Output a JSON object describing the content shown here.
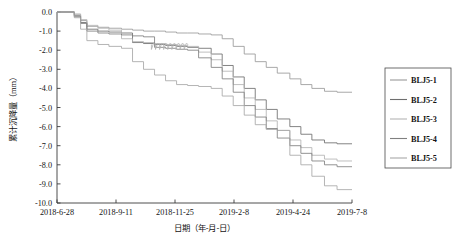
{
  "chart_data": {
    "type": "line",
    "title": "",
    "xlabel": "日期（年-月-日）",
    "ylabel": "累计沉降量（mm）",
    "x_tick_labels": [
      "2018-6-28",
      "2018-9-11",
      "2018-11-25",
      "2019-2-8",
      "2019-4-24",
      "2019-7-8"
    ],
    "y_tick_labels": [
      "0.0",
      "-1.0",
      "-2.0",
      "-3.0",
      "-4.0",
      "-5.0",
      "-6.0",
      "-7.0",
      "-8.0",
      "-9.0",
      "-10.0"
    ],
    "ylim": [
      -10.0,
      0.0
    ],
    "xlim": [
      0,
      375
    ],
    "grid": false,
    "legend_position": "right-outside",
    "x_tick_days": [
      0,
      75,
      150,
      225,
      300,
      375
    ],
    "series": [
      {
        "name": "BLJ5-1",
        "color": "#9a9a9a",
        "x": [
          0,
          14,
          22,
          30,
          38,
          52,
          66,
          82,
          96,
          110,
          124,
          138,
          152,
          166,
          180,
          196,
          210,
          224,
          238,
          252,
          266,
          280,
          296,
          310,
          324,
          340,
          356,
          375
        ],
        "y": [
          0.0,
          0.0,
          -0.15,
          -0.45,
          -0.75,
          -0.8,
          -0.85,
          -0.9,
          -0.95,
          -1.0,
          -1.0,
          -1.05,
          -1.1,
          -1.1,
          -1.15,
          -1.2,
          -1.4,
          -1.8,
          -2.2,
          -2.6,
          -2.9,
          -3.2,
          -3.5,
          -3.8,
          -4.0,
          -4.15,
          -4.2,
          -4.2
        ]
      },
      {
        "name": "BLJ5-2",
        "color": "#6e6e6e",
        "x": [
          0,
          14,
          22,
          30,
          38,
          52,
          66,
          82,
          96,
          110,
          124,
          138,
          152,
          166,
          180,
          196,
          210,
          224,
          238,
          252,
          266,
          280,
          296,
          310,
          324,
          340,
          356,
          375
        ],
        "y": [
          0.0,
          0.0,
          -0.2,
          -0.55,
          -0.9,
          -1.0,
          -1.05,
          -1.1,
          -1.6,
          -1.65,
          -1.7,
          -1.75,
          -1.8,
          -1.85,
          -1.9,
          -2.2,
          -2.8,
          -3.4,
          -4.0,
          -4.6,
          -5.1,
          -5.6,
          -6.0,
          -6.4,
          -6.7,
          -6.85,
          -6.9,
          -6.9
        ]
      },
      {
        "name": "BLJ5-3",
        "color": "#b4b4b4",
        "x": [
          0,
          14,
          22,
          30,
          38,
          52,
          66,
          82,
          96,
          110,
          124,
          138,
          152,
          166,
          180,
          196,
          210,
          224,
          238,
          252,
          266,
          280,
          296,
          310,
          324,
          340,
          356,
          375
        ],
        "y": [
          0.0,
          0.0,
          -0.1,
          -0.4,
          -0.7,
          -0.85,
          -0.95,
          -1.4,
          -1.55,
          -1.6,
          -1.65,
          -1.7,
          -1.75,
          -1.8,
          -2.1,
          -2.5,
          -3.1,
          -3.8,
          -4.5,
          -5.1,
          -5.7,
          -6.2,
          -6.7,
          -7.1,
          -7.5,
          -7.7,
          -7.8,
          -7.8
        ]
      },
      {
        "name": "BLJ5-4",
        "color": "#808080",
        "x": [
          0,
          14,
          22,
          30,
          38,
          52,
          66,
          82,
          96,
          110,
          124,
          138,
          152,
          166,
          180,
          196,
          210,
          224,
          238,
          252,
          266,
          280,
          296,
          310,
          324,
          340,
          356,
          375
        ],
        "y": [
          0.0,
          0.0,
          -0.25,
          -0.6,
          -1.0,
          -1.1,
          -1.15,
          -1.2,
          -1.25,
          -1.3,
          -1.85,
          -1.9,
          -1.95,
          -2.0,
          -2.4,
          -2.9,
          -3.5,
          -4.2,
          -4.9,
          -5.5,
          -6.1,
          -6.6,
          -7.0,
          -7.4,
          -7.8,
          -8.0,
          -8.1,
          -8.1
        ]
      },
      {
        "name": "BLJ5-5",
        "color": "#a8a8a8",
        "x": [
          0,
          14,
          22,
          30,
          38,
          52,
          66,
          82,
          96,
          110,
          124,
          138,
          152,
          166,
          180,
          196,
          210,
          224,
          238,
          252,
          266,
          280,
          296,
          310,
          324,
          340,
          356,
          375
        ],
        "y": [
          0.0,
          0.0,
          -0.3,
          -0.9,
          -1.5,
          -1.7,
          -1.8,
          -1.9,
          -2.6,
          -3.0,
          -3.3,
          -3.6,
          -3.8,
          -3.85,
          -3.9,
          -4.0,
          -4.4,
          -4.9,
          -5.4,
          -5.9,
          -6.15,
          -6.2,
          -7.5,
          -8.0,
          -8.6,
          -9.1,
          -9.3,
          -9.3
        ]
      }
    ]
  },
  "legend": {
    "items": [
      {
        "label": "BLJ5-1",
        "color": "#9a9a9a"
      },
      {
        "label": "BLJ5-2",
        "color": "#6e6e6e"
      },
      {
        "label": "BLJ5-3",
        "color": "#b4b4b4"
      },
      {
        "label": "BLJ5-4",
        "color": "#808080"
      },
      {
        "label": "BLJ5-5",
        "color": "#a8a8a8"
      }
    ]
  }
}
